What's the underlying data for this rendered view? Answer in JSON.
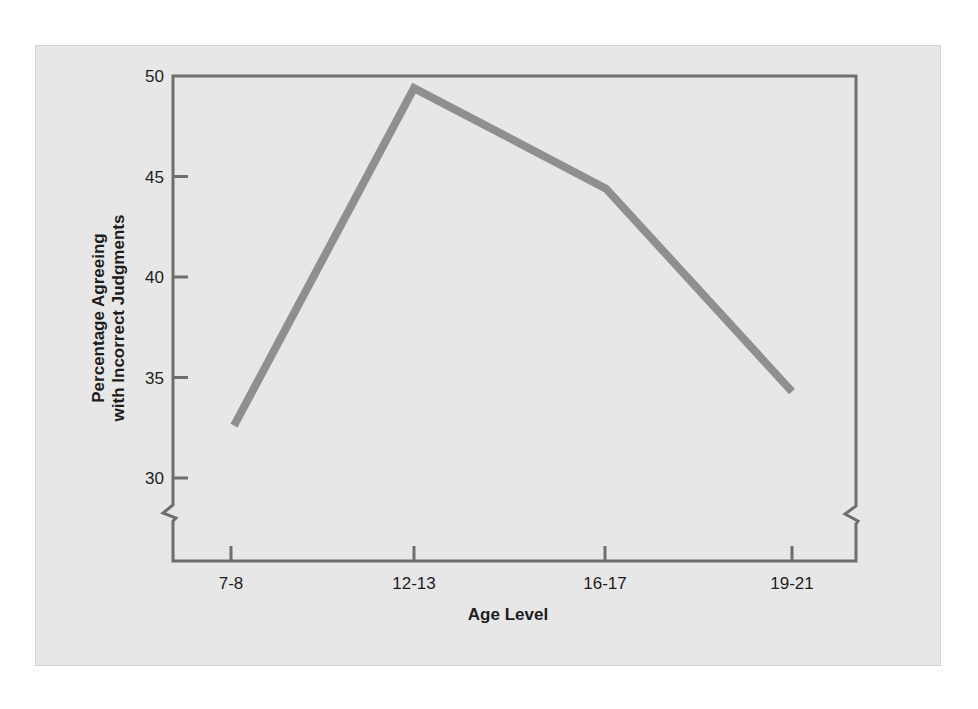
{
  "chart_data": {
    "type": "line",
    "title": "",
    "xlabel": "Age Level",
    "ylabel": [
      "Percentage Agreeing",
      "with Incorrect Judgments"
    ],
    "categories": [
      "7-8",
      "12-13",
      "16-17",
      "19-21"
    ],
    "series": [
      {
        "name": "Percentage agreeing",
        "values": [
          32.6,
          49.4,
          44.4,
          34.3
        ]
      }
    ],
    "yticks": [
      30,
      35,
      40,
      45,
      50
    ],
    "ylim": [
      30,
      50
    ],
    "axis_break": true,
    "grid": false,
    "legend": "none"
  },
  "colors": {
    "panel_bg": "#e7e7e7",
    "axis": "#6e6e6e",
    "line": "#8f8f8f",
    "text": "#1d1d1d"
  }
}
